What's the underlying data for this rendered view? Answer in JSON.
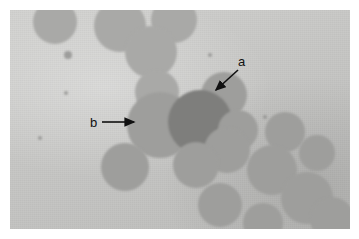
{
  "figure": {
    "kind": "light-microscopy-micrograph",
    "canvas": {
      "width": 359,
      "height": 239
    },
    "plate": {
      "left": 10,
      "top": 10,
      "width": 340,
      "height": 219
    },
    "colors": {
      "page_background": "#ffffff",
      "plate_background": "#c9c9c7",
      "cell_fill": "#9e9e9c",
      "cell_fill_dark": "#7e7e7c",
      "cell_fill_light": "#a9a9a7",
      "annotation": "#111111"
    }
  },
  "annotations": [
    {
      "id": "a",
      "label": "a",
      "label_x": 228,
      "label_y": 45,
      "arrow_x1": 228,
      "arrow_y1": 60,
      "arrow_x2": 206,
      "arrow_y2": 80,
      "points_to": "small-mid-gray-cell-upper-right"
    },
    {
      "id": "b",
      "label": "b",
      "label_x": 80,
      "label_y": 106,
      "arrow_x1": 92,
      "arrow_y1": 112,
      "arrow_x2": 124,
      "arrow_y2": 112,
      "points_to": "large-gray-cell-center-left"
    }
  ],
  "cells": [
    {
      "name": "cell-top-1",
      "cx": 45,
      "cy": 12,
      "r": 22,
      "tone": "light"
    },
    {
      "name": "cell-top-2",
      "cx": 110,
      "cy": 16,
      "r": 26,
      "tone": "light"
    },
    {
      "name": "cell-top-3",
      "cx": 164,
      "cy": 10,
      "r": 23,
      "tone": "light"
    },
    {
      "name": "cell-top-4",
      "cx": 141,
      "cy": 42,
      "r": 26,
      "tone": "light"
    },
    {
      "name": "cell-mid-left-1",
      "cx": 147,
      "cy": 82,
      "r": 22,
      "tone": "light"
    },
    {
      "name": "cell-a-target",
      "cx": 214,
      "cy": 85,
      "r": 23,
      "tone": "normal"
    },
    {
      "name": "cell-b-target",
      "cx": 150,
      "cy": 115,
      "r": 33,
      "tone": "normal"
    },
    {
      "name": "cell-center-dark",
      "cx": 190,
      "cy": 112,
      "r": 32,
      "tone": "dark"
    },
    {
      "name": "cell-right-1",
      "cx": 228,
      "cy": 120,
      "r": 20,
      "tone": "normal"
    },
    {
      "name": "cell-right-2",
      "cx": 217,
      "cy": 140,
      "r": 23,
      "tone": "normal"
    },
    {
      "name": "cell-right-3",
      "cx": 275,
      "cy": 122,
      "r": 20,
      "tone": "normal"
    },
    {
      "name": "cell-lower-1",
      "cx": 115,
      "cy": 157,
      "r": 24,
      "tone": "normal"
    },
    {
      "name": "cell-lower-2",
      "cx": 186,
      "cy": 155,
      "r": 23,
      "tone": "normal"
    },
    {
      "name": "cell-lower-3",
      "cx": 262,
      "cy": 160,
      "r": 25,
      "tone": "normal"
    },
    {
      "name": "cell-lower-4",
      "cx": 307,
      "cy": 143,
      "r": 18,
      "tone": "normal"
    },
    {
      "name": "cell-lower-5",
      "cx": 297,
      "cy": 188,
      "r": 26,
      "tone": "normal"
    },
    {
      "name": "cell-lower-6",
      "cx": 210,
      "cy": 195,
      "r": 22,
      "tone": "normal"
    },
    {
      "name": "cell-lower-7",
      "cx": 253,
      "cy": 213,
      "r": 20,
      "tone": "normal"
    },
    {
      "name": "cell-lower-8",
      "cx": 322,
      "cy": 209,
      "r": 22,
      "tone": "normal"
    }
  ],
  "specks": [
    {
      "name": "speck-1",
      "cx": 58,
      "cy": 45,
      "r": 4
    },
    {
      "name": "speck-2",
      "cx": 56,
      "cy": 83,
      "r": 2
    },
    {
      "name": "speck-3",
      "cx": 200,
      "cy": 45,
      "r": 2
    },
    {
      "name": "speck-4",
      "cx": 255,
      "cy": 107,
      "r": 2
    },
    {
      "name": "speck-5",
      "cx": 30,
      "cy": 128,
      "r": 2
    }
  ]
}
